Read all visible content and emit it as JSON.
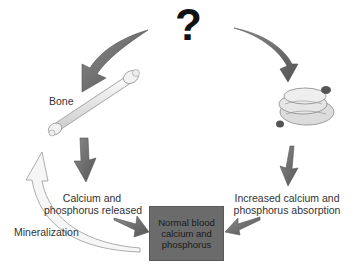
{
  "diagram": {
    "title_symbol": "?",
    "nodes": {
      "bone": {
        "label": "Bone",
        "icon": "bone-icon"
      },
      "intestine": {
        "label": "",
        "icon": "intestine-icon"
      },
      "calcium_released": {
        "label_line1": "Calcium and",
        "label_line2": "phosphorus released"
      },
      "increased_absorption": {
        "label_line1": "Increased calcium and",
        "label_line2": "phosphorus absorption"
      },
      "center": {
        "label": "Normal blood\ncalcium and\nphosphorus"
      },
      "mineralization": {
        "label": "Mineralization"
      }
    },
    "edges": [
      {
        "from": "?",
        "to": "bone"
      },
      {
        "from": "?",
        "to": "intestine"
      },
      {
        "from": "bone",
        "to": "calcium_released"
      },
      {
        "from": "intestine",
        "to": "increased_absorption"
      },
      {
        "from": "calcium_released",
        "to": "center"
      },
      {
        "from": "increased_absorption",
        "to": "center"
      },
      {
        "from": "center",
        "to": "bone",
        "label": "Mineralization"
      }
    ],
    "colors": {
      "arrow_dark": "#6e6e6e",
      "arrow_light": "#f4f4f4",
      "box_fill": "#6b6b6b",
      "text": "#333333"
    }
  }
}
